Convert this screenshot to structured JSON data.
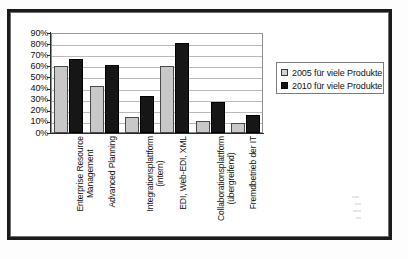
{
  "chart_data": {
    "type": "bar",
    "title": "",
    "subtitle": "",
    "xlabel": "",
    "ylabel": "",
    "ylim": [
      0,
      90
    ],
    "ytick_step": 10,
    "grid": true,
    "legend_position": "right",
    "categories": [
      "Enterprise Resource Management",
      "Advanced Planning",
      "Integrationsplattform (intern)",
      "EDI, Web-EDI, XML",
      "Collaborationsplattform (übergreifend)",
      "Fremdbetrieb der IT"
    ],
    "category_lines": [
      [
        "Enterprise Resource",
        "Management"
      ],
      [
        "Advanced Planning",
        ""
      ],
      [
        "Integrationsplattform",
        "(intern)"
      ],
      [
        "EDI, Web-EDI, XML",
        ""
      ],
      [
        "Collaborationsplattform",
        "(übergreifend)"
      ],
      [
        "Fremdbetrieb der IT",
        ""
      ]
    ],
    "ytick_labels": [
      "90%",
      "80%",
      "70%",
      "60%",
      "50%",
      "40%",
      "30%",
      "20%",
      "10%",
      "0%"
    ],
    "ytick_values": [
      90,
      80,
      70,
      60,
      50,
      40,
      30,
      20,
      10,
      0
    ],
    "series": [
      {
        "name": "2005 für viele Produkte",
        "color": "#c8c8c8",
        "values": [
          60,
          42,
          14,
          60,
          11,
          9
        ]
      },
      {
        "name": "2010 für viele Produkte",
        "color": "#161616",
        "values": [
          67,
          61,
          33,
          81,
          28,
          16
        ]
      }
    ]
  },
  "legend": {
    "items": [
      {
        "label": "2005 für viele Produkte",
        "swatch": "light-gray-square"
      },
      {
        "label": "2010 für viele Produkte",
        "swatch": "black-square"
      }
    ]
  },
  "colors": {
    "series_2005": "#c8c8c8",
    "series_2010": "#161616",
    "frame": "#1b1b1b",
    "gridline": "#b9b9b9",
    "axis": "#2a2a2a",
    "text": "#111111",
    "background": "#ffffff"
  }
}
